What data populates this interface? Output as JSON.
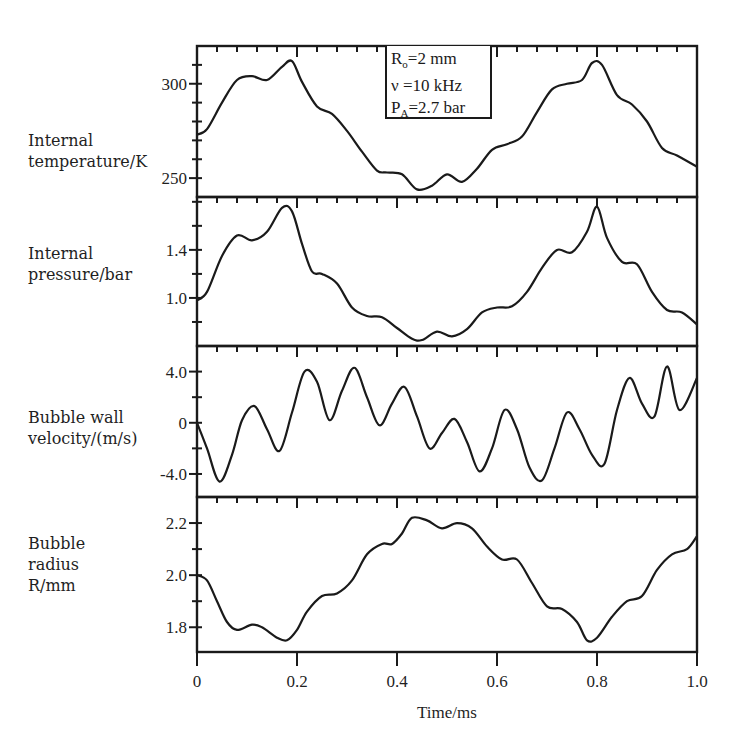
{
  "chart_data": [
    {
      "type": "line",
      "panel": "internal-temperature",
      "ylabel": "Internal temperature/K",
      "ylabel_lines": [
        "Internal",
        "temperature/K"
      ],
      "xlabel": "Time/ms",
      "ylim": [
        240,
        320
      ],
      "yticks": [
        250,
        300
      ],
      "ytick_labels": [
        "250",
        "300"
      ],
      "yminor_step": 10,
      "x": [
        0,
        0.02,
        0.05,
        0.08,
        0.11,
        0.14,
        0.17,
        0.19,
        0.21,
        0.24,
        0.27,
        0.3,
        0.33,
        0.36,
        0.38,
        0.41,
        0.44,
        0.47,
        0.5,
        0.53,
        0.56,
        0.59,
        0.62,
        0.65,
        0.68,
        0.71,
        0.74,
        0.77,
        0.79,
        0.81,
        0.84,
        0.87,
        0.9,
        0.93,
        0.96,
        1.0
      ],
      "values": [
        273,
        276,
        290,
        302,
        304,
        302,
        309,
        312,
        301,
        288,
        284,
        275,
        264,
        254,
        253,
        252,
        244,
        246,
        252,
        248,
        255,
        265,
        268,
        272,
        285,
        297,
        300,
        302,
        311,
        310,
        294,
        289,
        280,
        266,
        262,
        256
      ]
    },
    {
      "type": "line",
      "panel": "internal-pressure",
      "ylabel": "Internal pressure/bar",
      "ylabel_lines": [
        "Internal",
        "pressure/bar"
      ],
      "xlabel": "Time/ms",
      "ylim": [
        0.6,
        1.84
      ],
      "yticks": [
        1.0,
        1.4
      ],
      "ytick_labels": [
        "1.0",
        "1.4"
      ],
      "yminor_step": 0.2,
      "x": [
        0,
        0.02,
        0.05,
        0.08,
        0.11,
        0.14,
        0.17,
        0.19,
        0.21,
        0.23,
        0.25,
        0.28,
        0.31,
        0.34,
        0.37,
        0.4,
        0.43,
        0.45,
        0.48,
        0.51,
        0.54,
        0.57,
        0.6,
        0.63,
        0.66,
        0.69,
        0.72,
        0.75,
        0.78,
        0.8,
        0.82,
        0.85,
        0.88,
        0.91,
        0.94,
        0.97,
        1.0
      ],
      "values": [
        0.98,
        1.05,
        1.35,
        1.52,
        1.48,
        1.55,
        1.75,
        1.72,
        1.45,
        1.22,
        1.2,
        1.12,
        0.92,
        0.85,
        0.84,
        0.75,
        0.66,
        0.65,
        0.72,
        0.68,
        0.74,
        0.88,
        0.92,
        0.93,
        1.05,
        1.25,
        1.4,
        1.38,
        1.55,
        1.76,
        1.5,
        1.3,
        1.28,
        1.05,
        0.9,
        0.88,
        0.78
      ]
    },
    {
      "type": "line",
      "panel": "bubble-wall-velocity",
      "ylabel": "Bubble wall velocity/(m/s)",
      "ylabel_lines": [
        "Bubble wall",
        "velocity/(m/s)"
      ],
      "xlabel": "Time/ms",
      "ylim": [
        -5.8,
        6.0
      ],
      "yticks": [
        -4.0,
        0,
        4.0
      ],
      "ytick_labels": [
        "-4.0",
        "0",
        "4.0"
      ],
      "yminor_step": 2.0,
      "x": [
        0,
        0.02,
        0.045,
        0.07,
        0.09,
        0.115,
        0.14,
        0.165,
        0.19,
        0.215,
        0.24,
        0.265,
        0.29,
        0.315,
        0.34,
        0.365,
        0.39,
        0.415,
        0.44,
        0.465,
        0.49,
        0.515,
        0.54,
        0.565,
        0.59,
        0.615,
        0.64,
        0.665,
        0.69,
        0.715,
        0.74,
        0.765,
        0.79,
        0.815,
        0.84,
        0.865,
        0.89,
        0.915,
        0.94,
        0.965,
        1.0
      ],
      "values": [
        0,
        -2.0,
        -4.6,
        -2.5,
        0.2,
        1.3,
        -0.5,
        -2.2,
        0.8,
        4.0,
        3.2,
        0.2,
        2.5,
        4.3,
        2.0,
        -0.2,
        1.5,
        2.8,
        0.5,
        -2.0,
        -0.8,
        0.3,
        -1.5,
        -3.8,
        -2.0,
        1.0,
        -0.5,
        -3.5,
        -4.5,
        -2.0,
        0.8,
        -0.5,
        -2.5,
        -3.2,
        1.0,
        3.5,
        1.5,
        0.5,
        4.4,
        1.0,
        3.5
      ]
    },
    {
      "type": "line",
      "panel": "bubble-radius",
      "ylabel": "Bubble radius R/mm",
      "ylabel_lines": [
        "Bubble",
        "radius",
        "R/mm"
      ],
      "xlabel": "Time/ms",
      "ylim": [
        1.705,
        2.3
      ],
      "yticks": [
        1.8,
        2.0,
        2.2
      ],
      "ytick_labels": [
        "1.8",
        "2.0",
        "2.2"
      ],
      "yminor_step": 0.1,
      "x": [
        0,
        0.02,
        0.04,
        0.06,
        0.08,
        0.11,
        0.13,
        0.16,
        0.18,
        0.2,
        0.22,
        0.25,
        0.28,
        0.31,
        0.34,
        0.37,
        0.39,
        0.41,
        0.43,
        0.46,
        0.49,
        0.52,
        0.55,
        0.58,
        0.61,
        0.64,
        0.67,
        0.7,
        0.73,
        0.76,
        0.78,
        0.8,
        0.83,
        0.86,
        0.89,
        0.92,
        0.95,
        0.98,
        1.0
      ],
      "values": [
        2.0,
        1.98,
        1.9,
        1.82,
        1.79,
        1.81,
        1.8,
        1.76,
        1.75,
        1.79,
        1.86,
        1.92,
        1.93,
        1.98,
        2.08,
        2.12,
        2.12,
        2.16,
        2.22,
        2.21,
        2.18,
        2.2,
        2.18,
        2.11,
        2.06,
        2.06,
        1.97,
        1.88,
        1.87,
        1.82,
        1.75,
        1.76,
        1.84,
        1.9,
        1.92,
        2.02,
        2.08,
        2.1,
        2.15
      ]
    }
  ],
  "figure": {
    "xlabel": "Time/ms",
    "xlim": [
      0,
      1.0
    ],
    "xticks": [
      0,
      0.2,
      0.4,
      0.6,
      0.8,
      1.0
    ],
    "xtick_labels": [
      "0",
      "0.2",
      "0.4",
      "0.6",
      "0.8",
      "1.0"
    ],
    "xminor_step": 0.04,
    "line_color": "#1a1a1a",
    "grid": false
  },
  "legend": {
    "line1_main": "R",
    "line1_sub": "o",
    "line1_rest": "=2 mm",
    "line2": "ν =10 kHz",
    "line3_main": "P",
    "line3_sub": "A",
    "line3_rest": "=2.7 bar"
  }
}
